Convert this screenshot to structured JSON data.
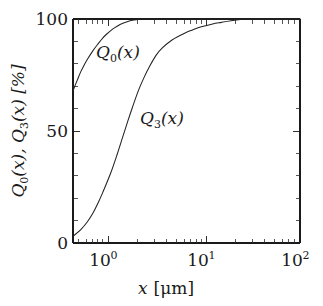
{
  "figure": {
    "background_color": "#ffffff",
    "line_color": "#222222",
    "axis_color": "#1a1a1a"
  },
  "axes": {
    "x": {
      "label_var": "x",
      "label_unit": "[μm]",
      "scale": "log",
      "min": 0.5,
      "max": 100,
      "major_ticks": [
        {
          "value": 1,
          "mantissa": "10",
          "exponent": "0"
        },
        {
          "value": 10,
          "mantissa": "10",
          "exponent": "1"
        },
        {
          "value": 100,
          "mantissa": "10",
          "exponent": "2"
        }
      ]
    },
    "y": {
      "label_parts": [
        "Q",
        "0",
        "(x), ",
        "Q",
        "3",
        "(x)  [%]"
      ],
      "scale": "linear",
      "min": 0,
      "max": 100,
      "major_ticks": [
        "0",
        "50",
        "100"
      ],
      "minor_tick_step": 10
    }
  },
  "curve_labels": [
    {
      "id": "Q0",
      "base": "Q",
      "sub": "0",
      "arg": "(x)",
      "x_px": 96,
      "y_px": 58
    },
    {
      "id": "Q3",
      "base": "Q",
      "sub": "3",
      "arg": "(x)",
      "x_px": 140,
      "y_px": 124
    }
  ],
  "chart_data": {
    "type": "line",
    "title": "",
    "xlabel": "x [μm]",
    "ylabel": "Q0(x), Q3(x) [%]",
    "xscale": "log",
    "yscale": "linear",
    "xlim": [
      0.5,
      100
    ],
    "ylim": [
      0,
      100
    ],
    "grid": false,
    "legend": "inline-annotations",
    "series": [
      {
        "name": "Q0(x)",
        "label": "Q0(x)",
        "x": [
          0.5,
          0.55,
          0.6,
          0.65,
          0.7,
          0.8,
          0.9,
          1.0,
          1.1,
          1.25,
          1.4,
          1.6,
          1.8,
          2.0,
          2.2,
          2.5,
          3.0,
          5.0,
          10.0,
          30.0,
          100.0
        ],
        "values": [
          68,
          72.5,
          76.5,
          79.5,
          82,
          86,
          89,
          91.5,
          93.3,
          95.4,
          96.8,
          98.1,
          98.9,
          99.4,
          99.7,
          100,
          100,
          100,
          100,
          100,
          100
        ]
      },
      {
        "name": "Q3(x)",
        "label": "Q3(x)",
        "x": [
          0.5,
          0.6,
          0.7,
          0.8,
          0.9,
          1.0,
          1.2,
          1.4,
          1.6,
          1.8,
          2.0,
          2.3,
          2.6,
          3.0,
          3.5,
          4.0,
          5.0,
          6.0,
          7.0,
          8.0,
          10.0,
          13.0,
          16.0,
          20.0,
          25.0,
          28.0,
          40.0,
          60.0,
          100.0
        ],
        "values": [
          3,
          6,
          9.5,
          13.5,
          18,
          22.5,
          31,
          39.5,
          47.5,
          54.5,
          60.5,
          68,
          73.5,
          79,
          84,
          87,
          90.5,
          92.5,
          94,
          95,
          96.5,
          97.8,
          98.5,
          99.2,
          99.8,
          100,
          100,
          100,
          100
        ]
      }
    ]
  }
}
